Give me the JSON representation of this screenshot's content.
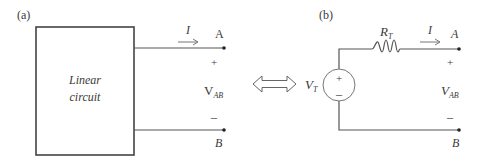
{
  "panel_a": {
    "label": "(a)",
    "box_text_line1": "Linear",
    "box_text_line2": "circuit",
    "current_label": "I",
    "terminal_a": "A",
    "terminal_b": "B",
    "plus": "+",
    "minus": "–",
    "voltage_main": "V",
    "voltage_sub": "AB"
  },
  "equivalence_symbol": "double-arrow-icon",
  "panel_b": {
    "label": "(b)",
    "resistor_main": "R",
    "resistor_sub": "T",
    "source_main": "V",
    "source_sub": "T",
    "source_plus": "+",
    "source_minus": "–",
    "current_label": "I",
    "terminal_a": "A",
    "terminal_b": "B",
    "plus": "+",
    "minus": "–",
    "voltage_main": "V",
    "voltage_sub": "AB"
  }
}
